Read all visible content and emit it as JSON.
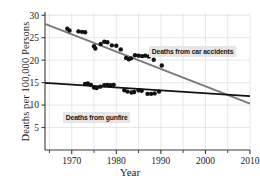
{
  "chart_data": {
    "type": "scatter",
    "title": "",
    "xlabel": "Year",
    "ylabel": "Deaths per 100,000 Persons",
    "xlim": [
      1964,
      2010
    ],
    "ylim": [
      0,
      30.5
    ],
    "xticks": [
      1970,
      1980,
      1990,
      2000,
      2010
    ],
    "xtick_labels": [
      "1970",
      "1980",
      "1990",
      "2000",
      "2010"
    ],
    "xminor_ticks": [
      1965,
      1975,
      1985,
      1995,
      2005
    ],
    "yticks": [
      5,
      10,
      15,
      20,
      25,
      30
    ],
    "ytick_labels": [
      "5",
      "10",
      "15",
      "20",
      "25",
      "30"
    ],
    "grid": "faint vertical and horizontal gridlines, light gray",
    "legend_position": "inline annotations on plot",
    "series": [
      {
        "name": "Deaths from car accidents",
        "color": "#7a7a7a",
        "marker_color": "#111111",
        "annotation": "Deaths from car accidents",
        "trendline": {
          "x": [
            1964,
            2010
          ],
          "y": [
            28.1,
            10.3
          ]
        },
        "points": [
          {
            "x": 1969,
            "y": 27.0
          },
          {
            "x": 1969.5,
            "y": 26.6
          },
          {
            "x": 1971.5,
            "y": 26.4
          },
          {
            "x": 1972.3,
            "y": 26.3
          },
          {
            "x": 1973.0,
            "y": 26.2
          },
          {
            "x": 1975.0,
            "y": 23.1
          },
          {
            "x": 1975.3,
            "y": 22.6
          },
          {
            "x": 1976.5,
            "y": 23.6
          },
          {
            "x": 1977.3,
            "y": 24.1
          },
          {
            "x": 1978.0,
            "y": 24.0
          },
          {
            "x": 1979.0,
            "y": 23.3
          },
          {
            "x": 1980.0,
            "y": 23.2
          },
          {
            "x": 1981.0,
            "y": 22.4
          },
          {
            "x": 1982.2,
            "y": 20.5
          },
          {
            "x": 1982.8,
            "y": 20.2
          },
          {
            "x": 1983.3,
            "y": 20.4
          },
          {
            "x": 1984.2,
            "y": 21.1
          },
          {
            "x": 1985.0,
            "y": 21.0
          },
          {
            "x": 1985.8,
            "y": 20.9
          },
          {
            "x": 1986.5,
            "y": 21.0
          },
          {
            "x": 1987.3,
            "y": 20.8
          },
          {
            "x": 1988.4,
            "y": 20.1
          },
          {
            "x": 1990.2,
            "y": 18.8
          }
        ]
      },
      {
        "name": "Deaths from gunfire",
        "color": "#121212",
        "marker_color": "#111111",
        "annotation": "Deaths from gunfire",
        "trendline": {
          "x": [
            1964,
            2010
          ],
          "y": [
            14.95,
            12.0
          ]
        },
        "points": [
          {
            "x": 1973.0,
            "y": 14.7
          },
          {
            "x": 1973.6,
            "y": 14.8
          },
          {
            "x": 1974.3,
            "y": 14.5
          },
          {
            "x": 1975.0,
            "y": 13.9
          },
          {
            "x": 1975.6,
            "y": 13.8
          },
          {
            "x": 1976.4,
            "y": 14.1
          },
          {
            "x": 1977.3,
            "y": 14.4
          },
          {
            "x": 1978.0,
            "y": 14.5
          },
          {
            "x": 1978.7,
            "y": 14.4
          },
          {
            "x": 1979.4,
            "y": 14.5
          },
          {
            "x": 1981.8,
            "y": 13.3
          },
          {
            "x": 1982.5,
            "y": 13.0
          },
          {
            "x": 1983.4,
            "y": 12.8
          },
          {
            "x": 1984.0,
            "y": 12.9
          },
          {
            "x": 1985.0,
            "y": 13.3
          },
          {
            "x": 1985.7,
            "y": 13.2
          },
          {
            "x": 1987.0,
            "y": 12.5
          },
          {
            "x": 1987.8,
            "y": 12.5
          },
          {
            "x": 1988.6,
            "y": 12.6
          },
          {
            "x": 1989.6,
            "y": 13.0
          }
        ]
      }
    ],
    "crossover_note": "trendlines intersect near year 2004 at about 12.3 deaths per 100,000"
  },
  "annotations": {
    "car": "Deaths from car accidents",
    "gunfire": "Deaths from gunfire"
  },
  "axis": {
    "x_title": "Year",
    "y_title": "Deaths per 100,000 Persons"
  },
  "colors": {
    "car_line": "#7a7a7a",
    "gun_line": "#121212",
    "marker": "#111111",
    "grid": "#dcdcdc",
    "axis": "#3a3a3a",
    "annotation_bg": "#e6e6e6"
  }
}
